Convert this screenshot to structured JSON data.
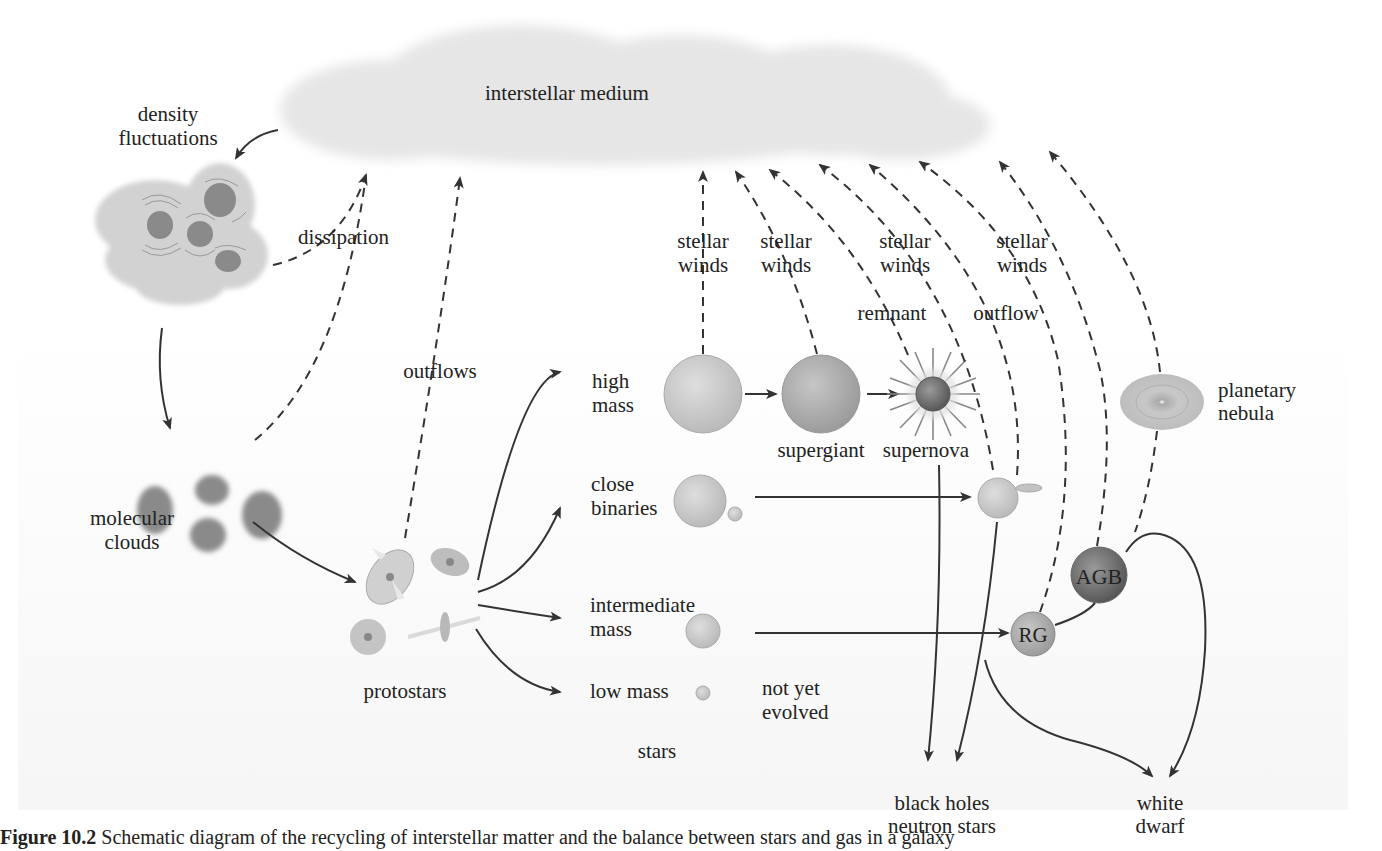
{
  "figure": {
    "caption_label": "Figure 10.2",
    "caption_text": " Schematic diagram of the recycling of interstellar matter and the balance between stars and gas in a galaxy"
  },
  "nodes": {
    "ism": "interstellar medium",
    "density_1": "density",
    "density_2": "fluctuations",
    "molecular_1": "molecular",
    "molecular_2": "clouds",
    "protostars": "protostars",
    "high_1": "high",
    "high_2": "mass",
    "close_1": "close",
    "close_2": "binaries",
    "inter_1": "intermediate",
    "inter_2": "mass",
    "low": "low mass",
    "not_yet_1": "not yet",
    "not_yet_2": "evolved",
    "stars": "stars",
    "supergiant": "supergiant",
    "supernova": "supernova",
    "planetary_1": "planetary",
    "planetary_2": "nebula",
    "agb": "AGB",
    "rg": "RG",
    "bh_1": "black holes",
    "bh_2": "neutron stars",
    "wd_1": "white",
    "wd_2": "dwarf"
  },
  "flows": {
    "dissipation": "dissipation",
    "outflows": "outflows",
    "sw1_1": "stellar",
    "sw1_2": "winds",
    "sw2_1": "stellar",
    "sw2_2": "winds",
    "sw3_1": "stellar",
    "sw3_2": "winds",
    "sw4_1": "stellar",
    "sw4_2": "winds",
    "remnant": "remnant",
    "outflow": "outflow"
  },
  "colors": {
    "ism_cloud": "#e6e6e6",
    "fluctuation_cloud": "#d2d2d2",
    "dense_clump": "#8a8a8a",
    "star_light": "#cfcfcf",
    "star_mid": "#b5b5b5",
    "star_dark": "#8f8f8f",
    "arrow": "#333333"
  }
}
